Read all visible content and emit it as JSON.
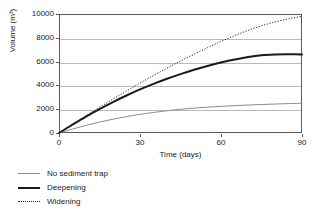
{
  "chart_data": {
    "type": "line",
    "title": "",
    "xlabel": "Time (days)",
    "ylabel": "Volume (m3)",
    "ylabel_display": "Volume (m³)",
    "xlim": [
      0,
      90
    ],
    "ylim": [
      0,
      10000
    ],
    "grid": true,
    "grid_axis": "y",
    "legend_position": "below-left",
    "x_ticks": [
      "0",
      "30",
      "60",
      "90"
    ],
    "x_tick_values": [
      0,
      30,
      60,
      90
    ],
    "y_ticks": [
      "0",
      "2000",
      "4000",
      "6000",
      "8000",
      "10000"
    ],
    "y_tick_values": [
      0,
      2000,
      4000,
      6000,
      8000,
      10000
    ],
    "x": [
      0,
      5,
      10,
      15,
      20,
      25,
      30,
      35,
      40,
      45,
      50,
      55,
      60,
      65,
      70,
      75,
      80,
      85,
      90
    ],
    "series": [
      {
        "name": "No sediment trap",
        "color": "#8c8c8c",
        "width": 1,
        "dash": "none",
        "values": [
          0,
          330,
          640,
          920,
          1160,
          1380,
          1570,
          1730,
          1870,
          1990,
          2090,
          2170,
          2240,
          2300,
          2350,
          2395,
          2435,
          2470,
          2500
        ]
      },
      {
        "name": "Deepening",
        "color": "#1a1a1a",
        "width": 2,
        "dash": "none",
        "values": [
          0,
          700,
          1380,
          2010,
          2600,
          3150,
          3660,
          4130,
          4560,
          4950,
          5310,
          5630,
          5920,
          6170,
          6390,
          6540,
          6600,
          6610,
          6600
        ]
      },
      {
        "name": "Widening",
        "color": "#2b2b2b",
        "width": 1,
        "dash": "dotted",
        "values": [
          0,
          730,
          1450,
          2160,
          2850,
          3530,
          4190,
          4830,
          5450,
          6050,
          6620,
          7170,
          7690,
          8180,
          8620,
          9010,
          9330,
          9600,
          9800
        ]
      }
    ]
  }
}
